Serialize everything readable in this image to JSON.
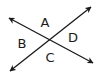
{
  "diagram": {
    "type": "intersecting-lines",
    "colors": {
      "line": "#1a1a1a",
      "label": "#1a1a1a",
      "background": "#ffffff"
    },
    "lines": [
      {
        "name": "line-1",
        "from": [
          9,
          18
        ],
        "to": [
          93,
          63
        ],
        "arrows": "both"
      },
      {
        "name": "line-2",
        "from": [
          10,
          71
        ],
        "to": [
          91,
          7
        ],
        "arrows": "both"
      }
    ],
    "intersection": [
      50,
      40
    ],
    "angles": [
      {
        "label": "A",
        "position": "top",
        "x": 45,
        "y": 27
      },
      {
        "label": "B",
        "position": "left",
        "x": 22,
        "y": 48
      },
      {
        "label": "C",
        "position": "bottom",
        "x": 50,
        "y": 62
      },
      {
        "label": "D",
        "position": "right",
        "x": 73,
        "y": 42
      }
    ]
  }
}
